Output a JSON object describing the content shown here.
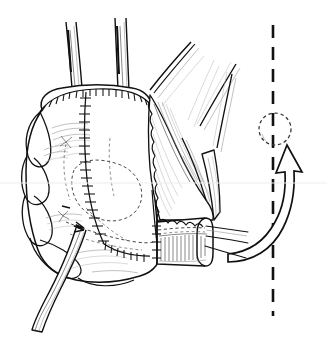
{
  "figure": {
    "domain_label": "Natural-Image",
    "media": "black ink pen-and-ink line drawing on white background",
    "canvas": {
      "width_px": 327,
      "height_px": 339,
      "background_color": "#ffffff"
    },
    "scan_artifact": {
      "name": "dark scan band at top edge",
      "color": "#4a4a4a",
      "height_px": 3
    }
  },
  "palette": {
    "ink_black": "#111111",
    "ink_mid_gray": "#3a3a3a",
    "ink_light_gray": "#8d8d8d",
    "ink_faint_gray": "#b4b4b4",
    "paper_white": "#ffffff",
    "scan_band_gray": "#4a4a4a"
  },
  "parts": {
    "organ": {
      "label": "main organ body with lobulated left margin",
      "position": "left and center of frame",
      "fill": "#ffffff",
      "outline_color": "#111111",
      "lobe_count": 4
    },
    "vessels_top": {
      "label": "two tubular vessels rising from the organ dome",
      "count": 2,
      "direction": "upward out of frame"
    },
    "strand_bundle": {
      "label": "bundle of thin diagonal strands at upper right of organ",
      "count": 4,
      "direction": "upper right"
    },
    "tissue_flap": {
      "label": "fan-shaped vascularized tissue flap with scalloped free edge",
      "edge": "scalloped / serrated",
      "shading": "fine parallel hatching"
    },
    "suture_line_top": {
      "label": "stapled suture line along the organ dome",
      "style": "rail with perpendicular ticks",
      "tick_count": 26
    },
    "suture_line_vertical": {
      "label": "stapled suture line running vertically down the organ face",
      "style": "rail with perpendicular ticks",
      "tick_count": 30
    },
    "suture_line_lower": {
      "label": "stapled suture line curving across the lower organ face",
      "style": "rail with perpendicular ticks",
      "tick_count": 14
    },
    "hidden_outlines": {
      "label": "dashed outlines indicating structures hidden beneath the surface",
      "style": "dashed"
    },
    "cuff": {
      "label": "cylindrical anastomotic cuff with circumferential hatching",
      "position": "lower right of organ",
      "hatch_count": 22,
      "suture_threads": 3
    },
    "drain_tube": {
      "label": "drain tube emerging from the organ and running to lower left",
      "direction": "lower left out of frame"
    }
  },
  "annotations": {
    "axis": {
      "name": "vertical dashed reference axis",
      "style": "long-dash",
      "color": "#111111",
      "x_px": 273,
      "from_y_px": 25,
      "to_y_px": 316
    },
    "target_circle": {
      "name": "dashed target circle on the axis",
      "style": "dashed",
      "center_x_px": 275,
      "center_y_px": 129,
      "radius_px": 16
    },
    "rotation_arrow": {
      "name": "curved rotation arrow sweeping up and over toward the target circle",
      "style": "open outline ribbon arrow",
      "direction": "counterclockwise, tip pointing up"
    }
  },
  "text_content": {
    "visible_labels": [],
    "note": "no text, captions, numbers or lettering appear anywhere in this image"
  }
}
